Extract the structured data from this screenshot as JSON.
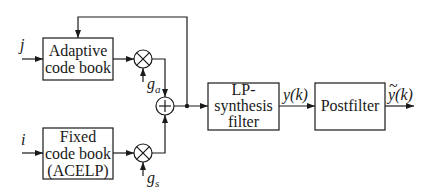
{
  "blocks": {
    "adaptive": {
      "line1": "Adaptive",
      "line2": "code book"
    },
    "fixed": {
      "line1": "Fixed",
      "line2": "code book",
      "line3": "(ACELP)"
    },
    "lp": {
      "line1": "LP-",
      "line2": "synthesis",
      "line3": "filter"
    },
    "postfilter": {
      "label": "Postfilter"
    }
  },
  "inputs": {
    "j": "j",
    "i": "i"
  },
  "gains": {
    "ga": "g",
    "ga_sub": "a",
    "gs": "g",
    "gs_sub": "s"
  },
  "signals": {
    "y": "y(k)",
    "ytilde": "y(k)",
    "ytilde_accent": "~"
  },
  "operators": {
    "multiply": "×",
    "add": "+"
  }
}
